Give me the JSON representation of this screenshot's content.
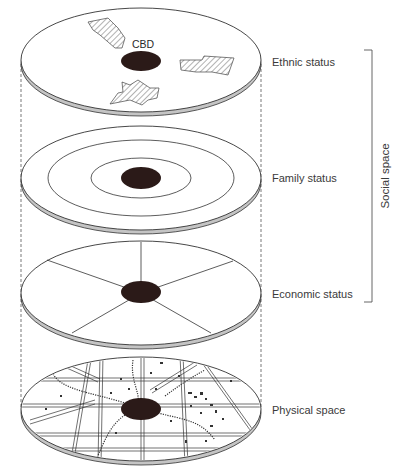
{
  "colors": {
    "cbd": "#2b1a18",
    "line": "#333333",
    "rim": "#b8b8b8",
    "hatch": "#555555",
    "text": "#3a3a3a"
  },
  "cbd_label": "CBD",
  "layers": [
    {
      "id": "ethnic",
      "label": "Ethnic status",
      "pattern": "hatched-patches",
      "cy": 60
    },
    {
      "id": "family",
      "label": "Family status",
      "pattern": "concentric-rings",
      "cy": 178
    },
    {
      "id": "economic",
      "label": "Economic status",
      "pattern": "sectors",
      "cy": 293
    },
    {
      "id": "physical",
      "label": "Physical space",
      "pattern": "street-grid",
      "cy": 409
    }
  ],
  "bracket": {
    "label": "Social space",
    "spans": [
      "Ethnic status",
      "Family status",
      "Economic status"
    ]
  },
  "geometry": {
    "cx": 141,
    "rx": 120,
    "ry": 52,
    "cbd_rx": 20,
    "cbd_ry": 11,
    "rim": 4
  }
}
